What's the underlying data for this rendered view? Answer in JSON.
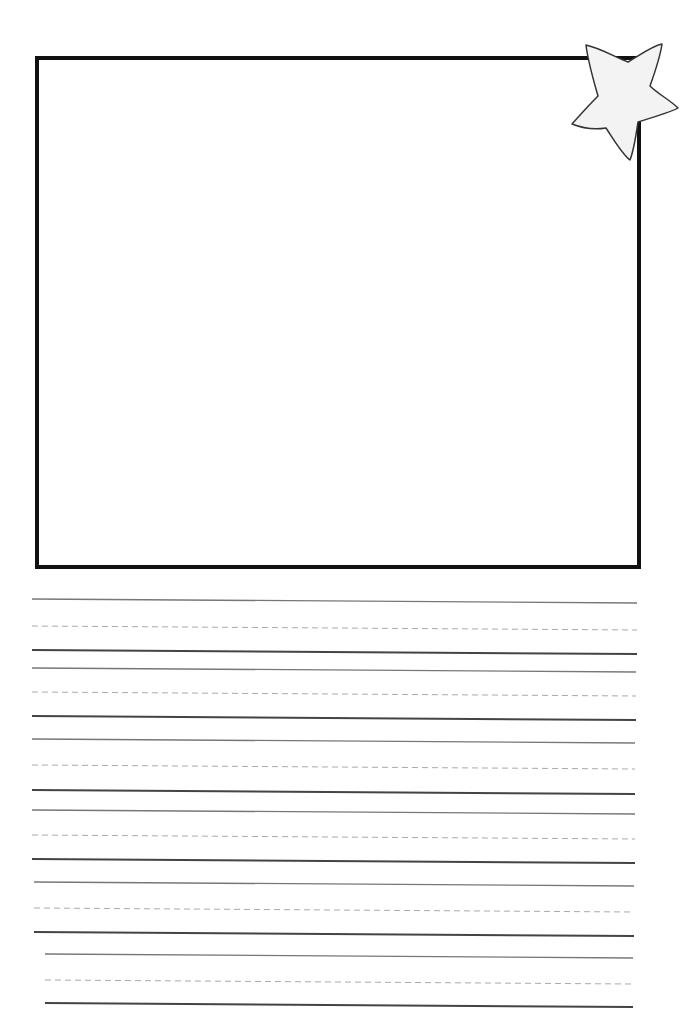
{
  "worksheet": {
    "type": "primary handwriting paper with drawing box",
    "drawing_box": {
      "x1": 37,
      "y1": 57,
      "x2": 639,
      "y2": 567,
      "stroke": "#111111",
      "stroke_width": 4
    },
    "decoration": {
      "icon": "star-icon",
      "fill": "#f2f2f2",
      "stroke": "#333333"
    },
    "line_groups": [
      {
        "top": 601,
        "mid": 628,
        "base": 652,
        "left": 32,
        "right": 637
      },
      {
        "top": 670,
        "mid": 694,
        "base": 718,
        "left": 32,
        "right": 636
      },
      {
        "top": 741,
        "mid": 767,
        "base": 792,
        "left": 32,
        "right": 635
      },
      {
        "top": 812,
        "mid": 837,
        "base": 861,
        "left": 32,
        "right": 635
      },
      {
        "top": 884,
        "mid": 910,
        "base": 934,
        "left": 34,
        "right": 634
      },
      {
        "top": 956,
        "mid": 982,
        "base": 1005,
        "left": 45,
        "right": 633
      }
    ],
    "colors": {
      "solid_top": "#777777",
      "dashed_mid": "#aaaaaa",
      "solid_base": "#444444"
    }
  }
}
